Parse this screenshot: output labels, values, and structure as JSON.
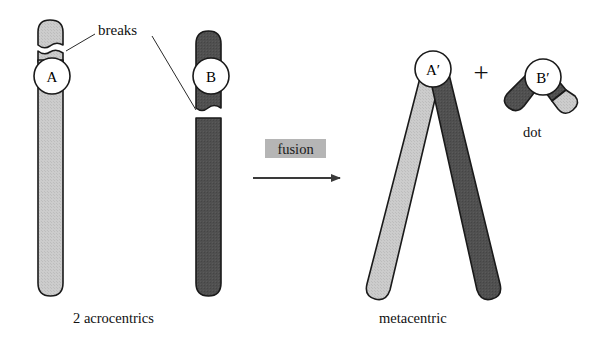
{
  "figure": {
    "title_visible": false,
    "background": "#ffffff"
  },
  "colors": {
    "light_chromatin": "#c9c9c9",
    "dark_chromatin": "#4f4f4f",
    "outline": "#1a1a1a",
    "centromere_fill": "#ffffff",
    "fusion_box": "#b3b3b3",
    "arrow": "#3a3a3a",
    "text": "#111111"
  },
  "annotations": {
    "breaks_label": "breaks",
    "fusion_label": "fusion",
    "plus_sign": "+",
    "dot_label": "dot"
  },
  "captions": {
    "left": "2 acrocentrics",
    "right": "metacentric"
  },
  "left_panel": {
    "chromosome_a": {
      "centromere_label": "A",
      "arm_color": "light_chromatin",
      "parts": [
        "short-arm-cap",
        "break-gap",
        "centromere-segment",
        "long-arm"
      ]
    },
    "chromosome_b": {
      "centromere_label": "B",
      "arm_color": "dark_chromatin",
      "parts": [
        "short-arm-cap",
        "centromere-segment",
        "break-gap",
        "long-arm"
      ]
    }
  },
  "right_panel": {
    "metacentric": {
      "centromere_label": "A′",
      "left_arm_color": "light_chromatin",
      "right_arm_color": "dark_chromatin"
    },
    "dot_chromosome": {
      "centromere_label": "B′",
      "left_arm_color": "dark_chromatin",
      "right_arm_color": "dark_chromatin",
      "right_tip_color": "light_chromatin",
      "label": "dot"
    }
  },
  "process": {
    "arrow_direction": "right",
    "arrow_label": "fusion"
  }
}
